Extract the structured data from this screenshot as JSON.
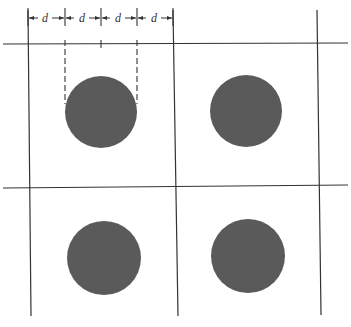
{
  "diagram": {
    "type": "square-lattice-spacing",
    "dimension_labels": [
      "d",
      "d",
      "d",
      "d"
    ],
    "dimension_ticks_x": [
      28,
      65,
      101,
      137,
      173
    ],
    "colors": {
      "line": "#333333",
      "particle": "#5a5a5a",
      "background": "#ffffff"
    },
    "grid": {
      "horizontal_lines_y": [
        44,
        188
      ],
      "vertical_lines_x": [
        29,
        176,
        318
      ]
    },
    "particles": [
      {
        "id": "top-left",
        "cx": 101,
        "cy": 112,
        "r": 36
      },
      {
        "id": "top-right",
        "cx": 246,
        "cy": 111,
        "r": 36
      },
      {
        "id": "bottom-left",
        "cx": 104,
        "cy": 258,
        "r": 37
      },
      {
        "id": "bottom-right",
        "cx": 248,
        "cy": 256,
        "r": 37
      }
    ]
  }
}
